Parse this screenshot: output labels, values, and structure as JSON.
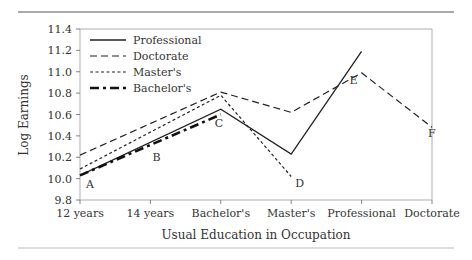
{
  "chart_data": {
    "type": "line",
    "title": "",
    "xlabel": "Usual Education in Occupation",
    "ylabel": "Log Earnings",
    "categories": [
      "12 years",
      "14 years",
      "Bachelor's",
      "Master's",
      "Professional",
      "Doctorate"
    ],
    "ylim": [
      9.8,
      11.4
    ],
    "yticks": [
      "9.8",
      "10.0",
      "10.2",
      "10.4",
      "10.6",
      "10.8",
      "11.0",
      "11.2",
      "11.4"
    ],
    "grid": false,
    "legend_position": "upper-left",
    "series": [
      {
        "name": "Professional",
        "style": "solid",
        "values": [
          10.03,
          null,
          10.65,
          10.23,
          11.19,
          null
        ]
      },
      {
        "name": "Doctorate",
        "style": "dashed",
        "values": [
          10.22,
          null,
          10.81,
          10.62,
          10.99,
          10.48
        ]
      },
      {
        "name": "Master's",
        "style": "dotted",
        "values": [
          10.09,
          null,
          10.78,
          10.02,
          null,
          null
        ]
      },
      {
        "name": "Bachelor's",
        "style": "thick-dash-dot",
        "values": [
          10.03,
          null,
          10.6,
          null,
          null,
          null
        ]
      }
    ],
    "annotations": [
      {
        "label": "A",
        "x": "12 years",
        "y": 9.95
      },
      {
        "label": "B",
        "x": "14 years",
        "y": 10.2
      },
      {
        "label": "C",
        "x": "Bachelor's",
        "y": 10.56
      },
      {
        "label": "D",
        "x": "Master's",
        "y": 9.96
      },
      {
        "label": "E",
        "x": "Professional",
        "y": 10.92
      },
      {
        "label": "F",
        "x": "Doctorate",
        "y": 10.43
      }
    ]
  },
  "legend": [
    {
      "label": "Professional"
    },
    {
      "label": "Doctorate"
    },
    {
      "label": "Master's"
    },
    {
      "label": "Bachelor's"
    }
  ]
}
